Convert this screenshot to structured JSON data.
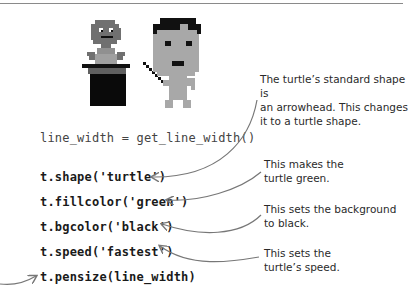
{
  "illustration": {
    "left_figure": "magician-in-top-hat",
    "right_figure": "pixel-boy-with-wand"
  },
  "code": {
    "line_width": "line_width = get_line_width()",
    "shape": "t.shape('turtle')",
    "fillcolor": "t.fillcolor('green')",
    "bgcolor": "t.bgcolor('black')",
    "speed": "t.speed('fastest')",
    "pensize": "t.pensize(line_width)"
  },
  "annotations": {
    "shape": [
      "The turtle’s standard shape is",
      "an arrowhead. This changes",
      "it to a turtle shape."
    ],
    "fillcolor": [
      "This makes the",
      "turtle green."
    ],
    "bgcolor": [
      "This sets the background",
      "to black."
    ],
    "speed": [
      "This sets the",
      "turtle’s speed."
    ]
  },
  "colors": {
    "text": "#222222",
    "arrow": "#777777",
    "pixel_dark": "#111111",
    "pixel_mid": "#707070",
    "pixel_light": "#a8a8a8"
  }
}
